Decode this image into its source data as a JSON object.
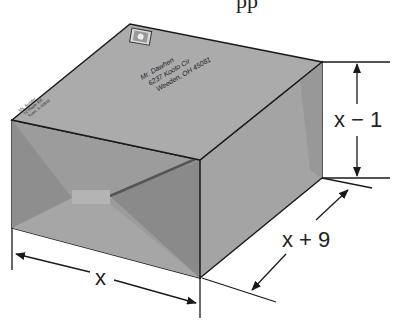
{
  "figure": {
    "colors": {
      "top_face": "#a9a9a9",
      "front_face": "#9a9a9a",
      "right_face": "#a2a2a2",
      "edge": "#1a1a1a"
    }
  },
  "top_text": {
    "partial_label": "pp"
  },
  "mailing_label": {
    "line1": "Mr. Dawhen",
    "line2": "6237 Kooto Cir",
    "line3": "Weeden, OH 45081"
  },
  "return_address": {
    "line1": "Ms. Sender",
    "line2": "12 Maple Rd",
    "line3": "Town, IL 60610"
  },
  "dimensions": {
    "height": "x − 1",
    "depth": "x + 9",
    "width": "x"
  }
}
